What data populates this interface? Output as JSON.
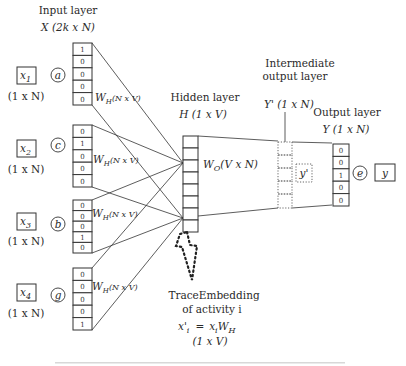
{
  "input_layer": {
    "title": "Input layer",
    "shape": "X (2k x N)",
    "weight_label": "W",
    "weight_sub": "H",
    "weight_dims": "(N x V)",
    "inputs": [
      {
        "var": "x",
        "sub": "1",
        "dims": "(1 x N)",
        "activity": "a",
        "vector": [
          "1",
          "0",
          "0",
          "0",
          "0"
        ]
      },
      {
        "var": "x",
        "sub": "2",
        "dims": "(1 x N)",
        "activity": "c",
        "vector": [
          "0",
          "1",
          "0",
          "0",
          "0"
        ]
      },
      {
        "var": "x",
        "sub": "3",
        "dims": "(1 x N)",
        "activity": "b",
        "vector": [
          "0",
          "0",
          "0",
          "1",
          "0"
        ]
      },
      {
        "var": "x",
        "sub": "4",
        "dims": "(1 x N)",
        "activity": "g",
        "vector": [
          "0",
          "0",
          "0",
          "0",
          "1"
        ]
      }
    ]
  },
  "hidden_layer": {
    "title": "Hidden layer",
    "shape": "H (1 x V)",
    "cells": 8,
    "weight_label": "W",
    "weight_sub": "O",
    "weight_dims": "(V x N)"
  },
  "intermediate_layer": {
    "title_line1": "Intermediate",
    "title_line2": "output layer",
    "shape": "Y' (1 x N)",
    "value": "y'"
  },
  "output_layer": {
    "title": "Output layer",
    "shape": "Y (1 x N)",
    "vector": [
      "0",
      "0",
      "1",
      "0",
      "0"
    ],
    "activity": "e",
    "var": "y"
  },
  "embedding": {
    "line1": "TraceEmbedding",
    "line2": "of activity i",
    "formula_lhs": "x'",
    "formula_lhs_sub": "i",
    "formula_eq": "=",
    "formula_rhs": "x",
    "formula_rhs_sub": "i",
    "formula_w": "W",
    "formula_w_sub": "H",
    "dims": "(1 x V)"
  }
}
